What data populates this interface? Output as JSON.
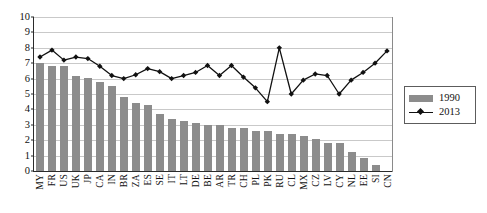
{
  "chart_data": {
    "type": "bar",
    "title": "",
    "subtitle": "",
    "xlabel": "",
    "ylabel": "",
    "ylim": [
      0,
      10
    ],
    "yticks": [
      0,
      1,
      2,
      3,
      4,
      5,
      6,
      7,
      8,
      9,
      10
    ],
    "grid": true,
    "legend_position": "right",
    "categories": [
      "MY",
      "FR",
      "US",
      "UK",
      "JP",
      "CA",
      "IN",
      "BR",
      "ZA",
      "ES",
      "SE",
      "IT",
      "LT",
      "DE",
      "BE",
      "AR",
      "TR",
      "CH",
      "PL",
      "PK",
      "RU",
      "CL",
      "MX",
      "CZ",
      "LV",
      "CY",
      "NL",
      "EE",
      "SI",
      "CN"
    ],
    "series": [
      {
        "name": "1990",
        "type": "bar",
        "color": "#8c8c8c",
        "values": [
          7.0,
          6.75,
          6.75,
          6.1,
          6.0,
          5.75,
          5.5,
          4.75,
          4.4,
          4.25,
          3.7,
          3.35,
          3.2,
          3.1,
          3.0,
          3.0,
          2.75,
          2.75,
          2.6,
          2.6,
          2.4,
          2.4,
          2.25,
          2.05,
          1.8,
          1.8,
          1.2,
          0.85,
          0.4,
          0.0
        ]
      },
      {
        "name": "2013",
        "type": "line",
        "color": "#111111",
        "marker": "diamond",
        "values": [
          7.4,
          7.85,
          7.2,
          7.4,
          7.3,
          6.8,
          6.2,
          6.0,
          6.25,
          6.65,
          6.45,
          6.0,
          6.2,
          6.4,
          6.85,
          6.2,
          6.85,
          6.1,
          5.4,
          4.5,
          8.0,
          5.0,
          5.9,
          6.3,
          6.2,
          5.0,
          5.9,
          6.4,
          7.0,
          7.8
        ]
      }
    ]
  },
  "legend": {
    "entries": [
      {
        "label": "1990",
        "marker": "bar-swatch"
      },
      {
        "label": "2013",
        "marker": "line-diamond"
      }
    ]
  }
}
